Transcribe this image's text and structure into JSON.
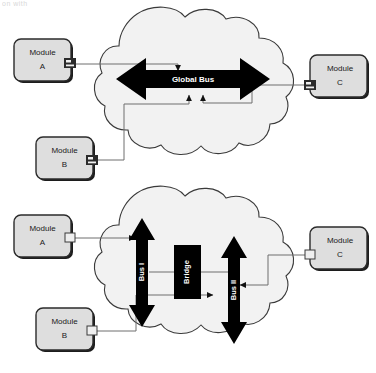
{
  "page": {
    "cut_off_header_text": "on with"
  },
  "diagrams": [
    {
      "id": "global-bus",
      "bus": {
        "label": "Global Bus",
        "type": "horizontal-double-arrow",
        "color": "#000000"
      },
      "modules": [
        {
          "id": "a",
          "label_line1": "Module",
          "label_line2": "A",
          "port_side": "right"
        },
        {
          "id": "b",
          "label_line1": "Module",
          "label_line2": "B",
          "port_side": "right"
        },
        {
          "id": "c",
          "label_line1": "Module",
          "label_line2": "C",
          "port_side": "left"
        }
      ]
    },
    {
      "id": "bridged-bus",
      "buses": [
        {
          "id": "bus-1",
          "label": "Bus I",
          "type": "vertical-double-arrow",
          "color": "#000000"
        },
        {
          "id": "bus-2",
          "label": "Bus II",
          "type": "vertical-double-arrow",
          "color": "#000000"
        }
      ],
      "bridge": {
        "label": "Bridge",
        "color": "#000000"
      },
      "modules": [
        {
          "id": "a",
          "label_line1": "Module",
          "label_line2": "A",
          "port_side": "right"
        },
        {
          "id": "b",
          "label_line1": "Module",
          "label_line2": "B",
          "port_side": "right"
        },
        {
          "id": "c",
          "label_line1": "Module",
          "label_line2": "C",
          "port_side": "left"
        }
      ]
    }
  ],
  "colors": {
    "module_fill": "#dedede",
    "module_stroke": "#2b2b2b",
    "cloud_fill": "#f2f2f2",
    "cloud_stroke": "#3a3a3a",
    "bus_fill": "#000000",
    "connector_line": "#6e6e6e",
    "shadow": "#1c1c1c"
  }
}
